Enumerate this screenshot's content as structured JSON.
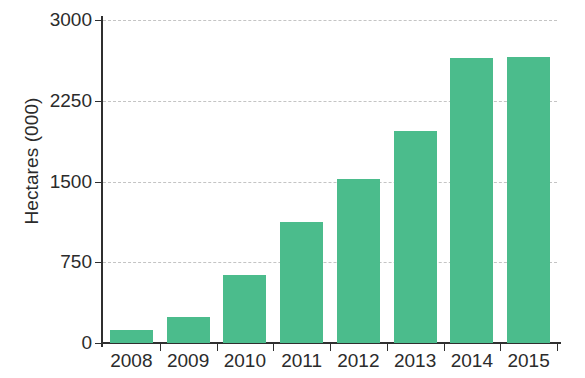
{
  "chart_data": {
    "type": "bar",
    "title": "",
    "xlabel": "",
    "ylabel": "Hectares (000)",
    "categories": [
      "2008",
      "2009",
      "2010",
      "2011",
      "2012",
      "2013",
      "2014",
      "2015"
    ],
    "values": [
      120,
      240,
      630,
      1120,
      1520,
      1970,
      2650,
      2660
    ],
    "ylim": [
      0,
      3000
    ],
    "yticks": [
      0,
      750,
      1500,
      2250,
      3000
    ],
    "ytick_labels": [
      "0",
      "750",
      "1500",
      "2250",
      "3000"
    ],
    "grid": true,
    "grid_axis": "y",
    "grid_style": "dashed",
    "legend": false,
    "series": [
      {
        "name": "Hectares (000)",
        "color": "#4bbc8c",
        "values": [
          120,
          240,
          630,
          1120,
          1520,
          1970,
          2650,
          2660
        ]
      }
    ]
  },
  "colors": {
    "bar": "#4bbc8c",
    "axis": "#2f2f2f",
    "grid": "#c4c4c4",
    "text": "#2b2b2b",
    "background": "#ffffff"
  }
}
